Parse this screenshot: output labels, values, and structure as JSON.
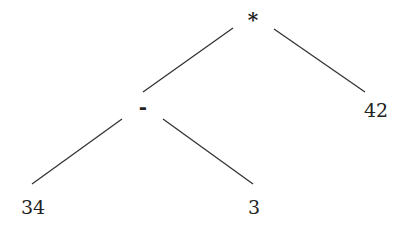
{
  "tree": {
    "root": {
      "label": "*",
      "x": 253,
      "y": 20
    },
    "minus": {
      "label": "-",
      "x": 143,
      "y": 107
    },
    "leaf_42": {
      "label": "42",
      "x": 376,
      "y": 110
    },
    "leaf_34": {
      "label": "34",
      "x": 33,
      "y": 207
    },
    "leaf_3": {
      "label": "3",
      "x": 254,
      "y": 207
    }
  },
  "edges": [
    {
      "from": "*",
      "to": "-",
      "x1": 233,
      "y1": 28,
      "x2": 143,
      "y2": 92
    },
    {
      "from": "*",
      "to": "42",
      "x1": 274,
      "y1": 29,
      "x2": 365,
      "y2": 92
    },
    {
      "from": "-",
      "to": "34",
      "x1": 122,
      "y1": 119,
      "x2": 32,
      "y2": 184
    },
    {
      "from": "-",
      "to": "3",
      "x1": 163,
      "y1": 119,
      "x2": 253,
      "y2": 184
    }
  ],
  "colors": {
    "line": "#333333",
    "text": "#222222"
  }
}
